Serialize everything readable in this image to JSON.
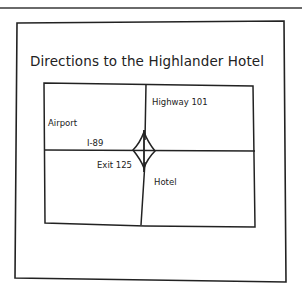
{
  "figure": {
    "title": "Directions to the Highlander Hotel",
    "labels": {
      "highway": "Highway 101",
      "airport": "Airport",
      "interstate": "I-89",
      "exit": "Exit 125",
      "hotel": "Hotel"
    }
  },
  "colors": {
    "ink": "#222222",
    "background": "#ffffff",
    "rule": "#6a6a6a"
  }
}
